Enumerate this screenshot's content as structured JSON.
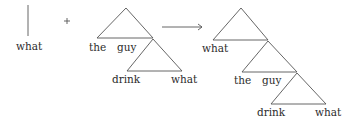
{
  "diagram": {
    "type": "syntax-tree-merge",
    "colors": {
      "line": "#555555",
      "text": "#2b2b2b",
      "background": "#ffffff"
    },
    "operand_left": {
      "label": "what",
      "shape": "vertical-line"
    },
    "operator": "+",
    "operand_right": {
      "tree": {
        "top_left_leaf": "the",
        "top_right_leaf": "guy",
        "sub_left_leaf": "drink",
        "sub_right_leaf": "what"
      }
    },
    "arrow": "→",
    "result": {
      "tree": {
        "level1_left_leaf": "what",
        "level2_left_leaf": "the",
        "level2_right_leaf": "guy",
        "level3_left_leaf": "drink",
        "level3_right_leaf": "what"
      }
    }
  }
}
